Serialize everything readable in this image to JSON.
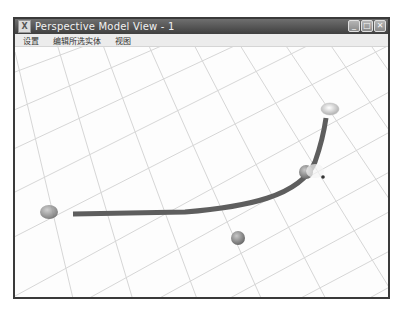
{
  "window": {
    "title": "Perspective Model View - 1",
    "controls": {
      "minimize": "_",
      "maximize": "□",
      "close": "✕"
    }
  },
  "menubar": {
    "items": [
      {
        "label": "设置"
      },
      {
        "label": "编辑所选实体"
      },
      {
        "label": "视图"
      }
    ]
  },
  "viewport": {
    "description": "3D perspective grid floor with a curved path and control-point spheres",
    "colors": {
      "grid": "#d4d4d4",
      "path": "#5e5e5e",
      "sphere": "#8c8c8c",
      "background": "#fdfdfd"
    }
  }
}
